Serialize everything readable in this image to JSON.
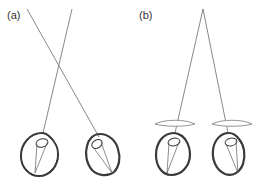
{
  "figure": {
    "panels": [
      {
        "label": "(a)",
        "description": "Two eyes viewing distant points along crossing rays (no corrective lenses)",
        "eyes": 2,
        "has_corrective_lenses": false
      },
      {
        "label": "(b)",
        "description": "Two eyes viewing a single near point through corrective lenses",
        "eyes": 2,
        "has_corrective_lenses": true
      }
    ],
    "colors": {
      "ray": "#6a6a6a",
      "eye_outline": "#3a3a3a",
      "corrective_lens": "#888888",
      "label": "#333333"
    }
  }
}
